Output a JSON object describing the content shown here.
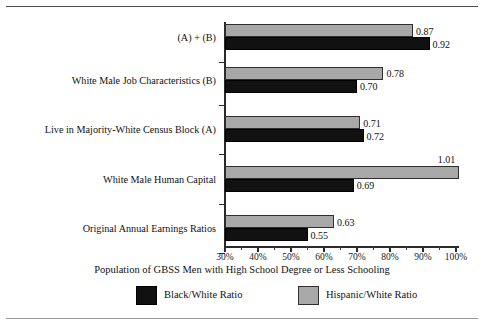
{
  "figure": {
    "x_caption": "Population of GBSS Men with High School Degree or Less Schooling"
  },
  "chart_data": {
    "type": "bar",
    "orientation": "horizontal",
    "title": "",
    "xlabel": "Population of GBSS Men with High School Degree or Less Schooling",
    "ylabel": "",
    "xlim": [
      30,
      105
    ],
    "xticks": [
      "30%",
      "40%",
      "50%",
      "60%",
      "70%",
      "80%",
      "90%",
      "100%"
    ],
    "xtick_values": [
      30,
      40,
      50,
      60,
      70,
      80,
      90,
      100
    ],
    "minor_tick_interval": 5,
    "grid": false,
    "legend_position": "bottom",
    "categories": [
      "Original Annual Earnings Ratios",
      "White Male Human Capital",
      "Live in Majority-White Census Block (A)",
      "White Male Job Characteristics (B)",
      "(A) + (B)"
    ],
    "series": [
      {
        "name": "Black/White Ratio",
        "color": "#111111",
        "values": [
          0.55,
          0.69,
          0.72,
          0.7,
          0.92
        ],
        "labels": [
          "0.55",
          "0.69",
          "0.72",
          "0.70",
          "0.92"
        ]
      },
      {
        "name": "Hispanic/White Ratio",
        "color": "#a8a8a8",
        "values": [
          0.63,
          1.01,
          0.71,
          0.78,
          0.87
        ],
        "labels": [
          "0.63",
          "1.01",
          "0.71",
          "0.78",
          "0.87"
        ]
      }
    ]
  },
  "legend": {
    "items": [
      {
        "label": "Black/White Ratio",
        "swatch": "black"
      },
      {
        "label": "Hispanic/White Ratio",
        "swatch": "hisp"
      }
    ]
  }
}
